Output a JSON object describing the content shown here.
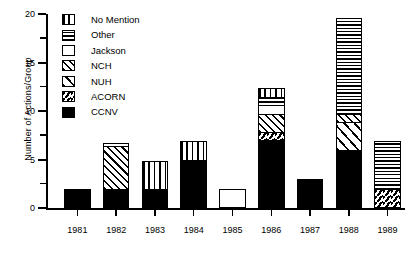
{
  "chart_data": {
    "type": "bar",
    "stacked": true,
    "title": "",
    "subtitle": "",
    "xlabel": "",
    "ylabel": "Number of Actions/Group",
    "categories": [
      "1981",
      "1982",
      "1983",
      "1984",
      "1985",
      "1986",
      "1987",
      "1988",
      "1989"
    ],
    "ylim": [
      0,
      20
    ],
    "yticks": [
      0,
      5,
      10,
      15,
      20
    ],
    "ytick_labels": [
      "0",
      "5",
      "10",
      "15",
      "20"
    ],
    "yminor_ticks": [
      2.5,
      7.5,
      12.5,
      17.5
    ],
    "grid": false,
    "legend_position": "upper-left-inside",
    "series": [
      {
        "name": "CCNV",
        "pattern": "solid-black",
        "values": [
          2,
          2,
          2,
          5,
          0,
          7,
          3,
          6,
          0
        ]
      },
      {
        "name": "ACORN",
        "pattern": "diagonal-medium",
        "values": [
          0,
          0,
          0,
          0,
          0,
          1,
          0,
          0,
          2
        ]
      },
      {
        "name": "NUH",
        "pattern": "diagonal-sparse",
        "values": [
          0,
          0,
          0,
          0,
          0,
          0,
          0,
          3,
          0
        ]
      },
      {
        "name": "NCH",
        "pattern": "diagonal-dense",
        "values": [
          0,
          4.5,
          0,
          0,
          0,
          2,
          0,
          1,
          0
        ]
      },
      {
        "name": "Jackson",
        "pattern": "blank-white",
        "values": [
          0,
          0,
          0,
          0,
          2,
          1,
          0,
          0,
          0
        ]
      },
      {
        "name": "Other",
        "pattern": "horizontal-lines",
        "values": [
          0,
          0.5,
          0,
          0,
          0,
          1,
          0,
          10,
          5
        ]
      },
      {
        "name": "No Mention",
        "pattern": "vertical-lines",
        "values": [
          0,
          0,
          3,
          2,
          0,
          1,
          0,
          0,
          0
        ]
      }
    ],
    "totals": [
      2,
      7,
      5,
      7,
      2,
      13,
      3,
      20,
      7
    ]
  },
  "legend": {
    "items": [
      {
        "label": "No Mention",
        "pattern": "vertical-lines"
      },
      {
        "label": "Other",
        "pattern": "horizontal-lines"
      },
      {
        "label": "Jackson",
        "pattern": "blank-white"
      },
      {
        "label": "NCH",
        "pattern": "diagonal-dense"
      },
      {
        "label": "NUH",
        "pattern": "diagonal-sparse"
      },
      {
        "label": "ACORN",
        "pattern": "diagonal-medium"
      },
      {
        "label": "CCNV",
        "pattern": "solid-black"
      }
    ]
  },
  "colors": {
    "ink": "#000000",
    "paper": "#ffffff"
  }
}
